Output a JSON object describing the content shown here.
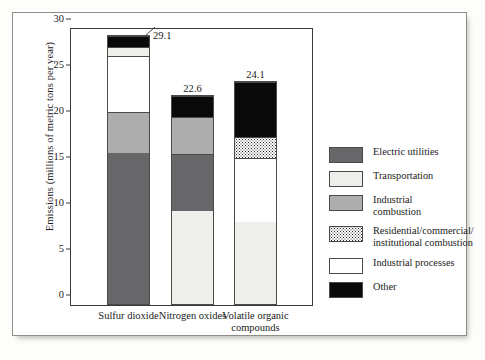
{
  "chart_data": {
    "type": "bar",
    "subtype": "stacked-bar",
    "title": "",
    "xlabel": "",
    "ylabel": "Emissions (millions of metric tons per year)",
    "ylim": [
      0,
      30
    ],
    "yticks": [
      0,
      5,
      10,
      15,
      20,
      25,
      30
    ],
    "ytick_labels": [
      "0",
      "5",
      "10",
      "15",
      "20",
      "25",
      "30"
    ],
    "grid": false,
    "legend_position": "right",
    "categories": [
      "Sulfur dioxide",
      "Nitrogen oxides",
      "Volatile organic compounds"
    ],
    "category_labels": [
      [
        "Sulfur dioxide"
      ],
      [
        "Nitrogen oxides"
      ],
      [
        "Volatile organic",
        "compounds"
      ]
    ],
    "series": [
      {
        "name": "Electric utilities",
        "color": "#67676a",
        "values": [
          16.4,
          6.2,
          0
        ]
      },
      {
        "name": "Transportation",
        "color": "#eeeeea",
        "values": [
          0.9,
          10.1,
          8.9
        ]
      },
      {
        "name": "Industrial combustion",
        "color": "#adadad",
        "values": [
          4.5,
          4.0,
          0
        ]
      },
      {
        "name": "Residential/commercial/institutional combustion",
        "color": "#ffffff",
        "values": [
          0,
          0,
          2.3
        ]
      },
      {
        "name": "Industrial processes",
        "color": "#ffffff",
        "values": [
          6.1,
          0,
          7.0
        ]
      },
      {
        "name": "Other",
        "color": "#0a0a0a",
        "values": [
          1.2,
          2.3,
          5.9
        ]
      }
    ],
    "totals": [
      29.1,
      22.6,
      24.1
    ],
    "total_labels": [
      "29.1",
      "22.6",
      "24.1"
    ],
    "stack_order_bottom_to_top": [
      [
        "Electric utilities",
        "Industrial combustion",
        "Industrial processes",
        "Transportation",
        "Other"
      ],
      [
        "Transportation",
        "Electric utilities",
        "Industrial combustion",
        "Other"
      ],
      [
        "Transportation",
        "Industrial processes",
        "Residential/commercial/institutional combustion",
        "Other"
      ]
    ]
  },
  "legend": {
    "items": [
      {
        "label": "Electric utilities",
        "swatch": "c-electric"
      },
      {
        "label": "Transportation",
        "swatch": "c-transport"
      },
      {
        "label": "Industrial combustion",
        "swatch": "c-indcomb"
      },
      {
        "label": "Residential/commercial/\ninstitutional combustion",
        "swatch": "c-resid"
      },
      {
        "label": "Industrial processes",
        "swatch": "c-white"
      },
      {
        "label": "Other",
        "swatch": "c-other"
      }
    ],
    "item_lines": [
      [
        "Electric utilities"
      ],
      [
        "Transportation"
      ],
      [
        "Industrial combustion"
      ],
      [
        "Residential/commercial/",
        "institutional combustion"
      ],
      [
        "Industrial processes"
      ],
      [
        "Other"
      ]
    ]
  },
  "axis": {
    "y_label": "Emissions (millions of metric tons per year)",
    "y_ticks": [
      "30",
      "25",
      "20",
      "15",
      "10",
      "5",
      "0"
    ]
  },
  "bars": [
    {
      "category": "Sulfur dioxide",
      "total_label": "29.1",
      "has_leader": true,
      "segments": [
        {
          "name": "Electric utilities",
          "value": 16.4,
          "swatch": "c-electric"
        },
        {
          "name": "Industrial combustion",
          "value": 4.5,
          "swatch": "c-indcomb"
        },
        {
          "name": "Industrial processes",
          "value": 6.1,
          "swatch": "c-white"
        },
        {
          "name": "Transportation",
          "value": 0.9,
          "swatch": "c-transport"
        },
        {
          "name": "Other",
          "value": 1.2,
          "swatch": "c-other"
        }
      ]
    },
    {
      "category": "Nitrogen oxides",
      "total_label": "22.6",
      "has_leader": false,
      "segments": [
        {
          "name": "Transportation",
          "value": 10.1,
          "swatch": "c-transport"
        },
        {
          "name": "Electric utilities",
          "value": 6.2,
          "swatch": "c-electric"
        },
        {
          "name": "Industrial combustion",
          "value": 4.0,
          "swatch": "c-indcomb"
        },
        {
          "name": "Other",
          "value": 2.3,
          "swatch": "c-other"
        }
      ]
    },
    {
      "category": "Volatile organic compounds",
      "total_label": "24.1",
      "has_leader": false,
      "segments": [
        {
          "name": "Transportation",
          "value": 8.9,
          "swatch": "c-transport"
        },
        {
          "name": "Industrial processes",
          "value": 7.0,
          "swatch": "c-white"
        },
        {
          "name": "Residential/commercial/institutional combustion",
          "value": 2.3,
          "swatch": "c-resid"
        },
        {
          "name": "Other",
          "value": 5.9,
          "swatch": "c-other"
        }
      ]
    }
  ]
}
